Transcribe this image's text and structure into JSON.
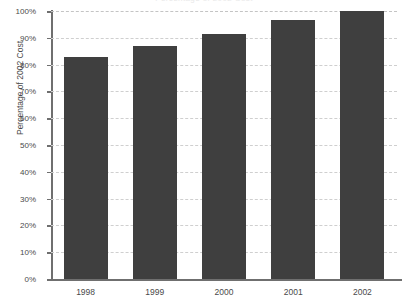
{
  "chart_data": {
    "type": "bar",
    "title": "Percentage of 2002 Cost",
    "xlabel": "",
    "ylabel": "Percentage of 2002 Cost",
    "categories": [
      "1998",
      "1999",
      "2000",
      "2001",
      "2002"
    ],
    "values": [
      83,
      87,
      91.5,
      96.5,
      100
    ],
    "ylim": [
      0,
      100
    ],
    "ytick_labels": [
      "0%",
      "10%",
      "20%",
      "30%",
      "40%",
      "50%",
      "60%",
      "70%",
      "80%",
      "90%",
      "100%"
    ],
    "ytick_values": [
      0,
      10,
      20,
      30,
      40,
      50,
      60,
      70,
      80,
      90,
      100
    ],
    "grid": true,
    "grid_axis": "y",
    "legend": false,
    "series": [
      {
        "name": "Percentage of 2002 Cost",
        "values": [
          83,
          87,
          91.5,
          96.5,
          100
        ]
      }
    ]
  },
  "colors": {
    "bar": "#3f3f3f",
    "gridline": "#cfcfcf",
    "axis": "#6f6f6f",
    "text": "#4a4a4a",
    "background": "#ffffff"
  }
}
